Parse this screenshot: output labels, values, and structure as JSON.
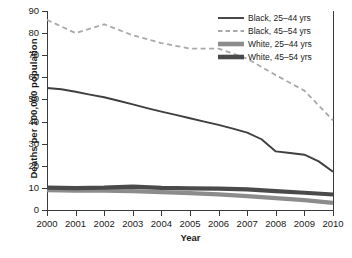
{
  "chart_data": {
    "type": "line",
    "title": "",
    "xlabel": "Year",
    "ylabel": "Deaths per 100,000 population",
    "x": [
      2000,
      2001,
      2002,
      2003,
      2004,
      2005,
      2006,
      2007,
      2008,
      2009,
      2010
    ],
    "categories": [
      "2000",
      "2001",
      "2002",
      "2003",
      "2004",
      "2005",
      "2006",
      "2007",
      "2008",
      "2009",
      "2010"
    ],
    "xlim": [
      2000,
      2010
    ],
    "ylim": [
      0,
      90
    ],
    "yticks": [
      0,
      10,
      20,
      30,
      40,
      50,
      60,
      70,
      80,
      90
    ],
    "ytick_labels": [
      "0",
      "10",
      "20",
      "30",
      "40",
      "50",
      "60",
      "70",
      "80",
      "90"
    ],
    "grid": false,
    "legend_position": "upper right",
    "series": [
      {
        "name": "Black, 25–44 yrs",
        "style": "solid-thin",
        "color": "#3f3f3f",
        "values": [
          55.2,
          53.5,
          51.0,
          47.8,
          44.5,
          41.5,
          38.5,
          35.0,
          30.5,
          27.0,
          25.0
        ]
      },
      {
        "name": "Black, 45–54 yrs",
        "style": "dashed",
        "color": "#a9a9a9",
        "values": [
          86.0,
          80.0,
          84.0,
          79.0,
          75.5,
          73.0,
          73.0,
          68.5,
          61.0,
          54.0,
          47.0
        ]
      },
      {
        "name": "White, 25–44 yrs",
        "style": "solid-thick",
        "color": "#8c8c8c",
        "values": [
          9.0,
          8.7,
          8.6,
          8.4,
          8.0,
          7.5,
          7.0,
          6.2,
          5.3,
          4.4,
          3.2
        ]
      },
      {
        "name": "White, 45–54 yrs",
        "style": "solid-thick",
        "color": "#4a4a4a",
        "values": [
          10.0,
          9.9,
          10.0,
          10.5,
          9.9,
          9.7,
          9.6,
          9.2,
          8.4,
          7.7,
          7.0
        ]
      }
    ],
    "series_render": {
      "black_25_44": [
        [
          2000,
          55.2
        ],
        [
          2000.5,
          54.6
        ],
        [
          2001,
          53.5
        ],
        [
          2001.5,
          52.2
        ],
        [
          2002,
          51.0
        ],
        [
          2002.5,
          49.4
        ],
        [
          2003,
          47.8
        ],
        [
          2003.5,
          46.1
        ],
        [
          2004,
          44.5
        ],
        [
          2004.5,
          43.0
        ],
        [
          2005,
          41.5
        ],
        [
          2005.5,
          40.0
        ],
        [
          2006,
          38.5
        ],
        [
          2006.5,
          36.8
        ],
        [
          2007,
          35.0
        ],
        [
          2007.5,
          32.0
        ],
        [
          2008,
          26.5
        ],
        [
          2008.5,
          25.8
        ],
        [
          2009,
          25.0
        ],
        [
          2009.5,
          22.0
        ],
        [
          2010,
          17.3
        ]
      ],
      "black_45_54": [
        [
          2000,
          86.0
        ],
        [
          2001,
          80.0
        ],
        [
          2002,
          84.0
        ],
        [
          2003,
          79.0
        ],
        [
          2004,
          75.5
        ],
        [
          2005,
          73.0
        ],
        [
          2006,
          73.0
        ],
        [
          2007,
          68.5
        ],
        [
          2008,
          61.0
        ],
        [
          2009,
          54.0
        ],
        [
          2010,
          40.5
        ]
      ],
      "white_25_44": [
        [
          2000,
          9.0
        ],
        [
          2001,
          8.8
        ],
        [
          2002,
          8.7
        ],
        [
          2003,
          8.5
        ],
        [
          2004,
          8.1
        ],
        [
          2005,
          7.6
        ],
        [
          2006,
          7.1
        ],
        [
          2007,
          6.3
        ],
        [
          2008,
          5.4
        ],
        [
          2009,
          4.5
        ],
        [
          2010,
          3.2
        ]
      ],
      "white_45_54": [
        [
          2000,
          10.1
        ],
        [
          2001,
          9.9
        ],
        [
          2002,
          10.1
        ],
        [
          2003,
          10.6
        ],
        [
          2004,
          10.0
        ],
        [
          2005,
          9.8
        ],
        [
          2006,
          9.7
        ],
        [
          2007,
          9.3
        ],
        [
          2008,
          8.5
        ],
        [
          2009,
          7.8
        ],
        [
          2010,
          7.0
        ]
      ]
    }
  },
  "legend": {
    "items": [
      {
        "label": "Black, 25–44 yrs",
        "style": "solid-thin",
        "color": "#3f3f3f"
      },
      {
        "label": "Black, 45–54 yrs",
        "style": "dashed",
        "color": "#a9a9a9"
      },
      {
        "label": "White, 25–44 yrs",
        "style": "solid-thick",
        "color": "#8c8c8c"
      },
      {
        "label": "White, 45–54 yrs",
        "style": "solid-thick",
        "color": "#4a4a4a"
      }
    ]
  },
  "axes": {
    "y_title": "Deaths per 100,000 population",
    "x_title": "Year"
  }
}
